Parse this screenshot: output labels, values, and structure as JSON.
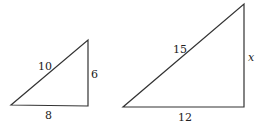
{
  "diagram": {
    "type": "similar right triangles",
    "small_triangle": {
      "hypotenuse_label": "10",
      "vertical_leg_label": "6",
      "horizontal_leg_label": "8"
    },
    "large_triangle": {
      "hypotenuse_label": "15",
      "vertical_leg_label": "x",
      "horizontal_leg_label": "12"
    }
  }
}
